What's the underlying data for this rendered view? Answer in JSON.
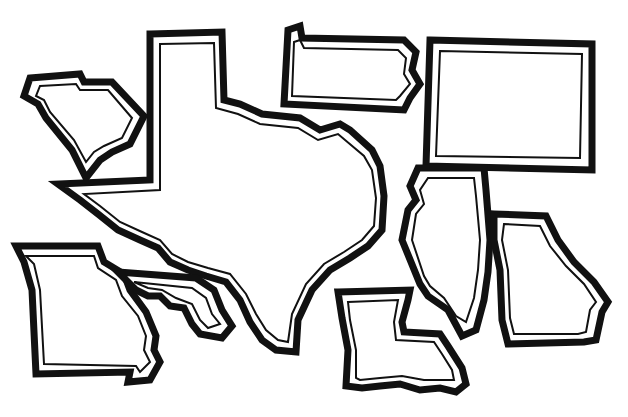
{
  "illustration": {
    "kind": "line-art map of US state outlines",
    "background": "#ffffff",
    "stroke_color": "#111111",
    "shapes": [
      {
        "id": "south-carolina"
      },
      {
        "id": "texas"
      },
      {
        "id": "pennsylvania"
      },
      {
        "id": "colorado"
      },
      {
        "id": "illinois"
      },
      {
        "id": "georgia"
      },
      {
        "id": "missouri"
      },
      {
        "id": "mississippi-river-delta"
      },
      {
        "id": "louisiana"
      }
    ]
  }
}
